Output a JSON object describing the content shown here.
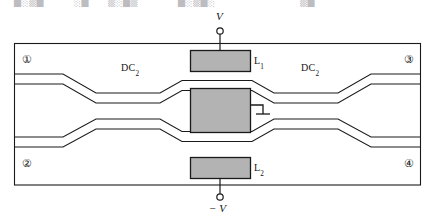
{
  "figure": {
    "kind": "optical-waveguide-device-diagram",
    "top_partial_text_fragments": [
      "█░▒█",
      "░█",
      "▒░█▒",
      "█░▒█░",
      "▒█"
    ]
  },
  "colors": {
    "electrode_fill": "#b3b3b3",
    "electrode_stroke": "#1a1a1a",
    "line": "#1a1a1a",
    "frame": "#1a1a1a",
    "background": "#ffffff"
  },
  "ports": [
    {
      "id": "port-1",
      "label": "①",
      "position": "top-left"
    },
    {
      "id": "port-2",
      "label": "②",
      "position": "bottom-left"
    },
    {
      "id": "port-3",
      "label": "③",
      "position": "top-right"
    },
    {
      "id": "port-4",
      "label": "④",
      "position": "bottom-right"
    }
  ],
  "couplers": [
    {
      "id": "coupler-left",
      "label_main": "DC",
      "label_sub": "2"
    },
    {
      "id": "coupler-right",
      "label_main": "DC",
      "label_sub": "2"
    }
  ],
  "electrodes": [
    {
      "id": "electrode-top",
      "label_main": "L",
      "label_sub": "1",
      "terminal": "V"
    },
    {
      "id": "electrode-center",
      "label_main": "",
      "label_sub": "",
      "terminal": "ground"
    },
    {
      "id": "electrode-bottom",
      "label_main": "L",
      "label_sub": "2",
      "terminal": "-V"
    }
  ],
  "terminals": [
    {
      "id": "terminal-top",
      "label": "V",
      "symbol": "open-circle"
    },
    {
      "id": "terminal-bottom",
      "label": "− V",
      "symbol": "open-circle"
    },
    {
      "id": "terminal-ground",
      "label": "",
      "symbol": "ground-stub"
    }
  ]
}
